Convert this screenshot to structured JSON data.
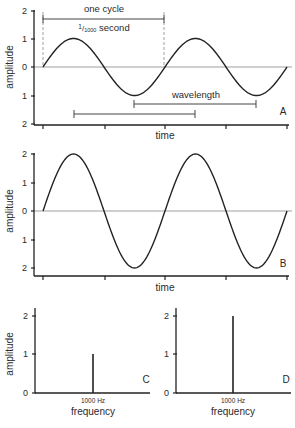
{
  "chart_data": [
    {
      "panel": "A",
      "type": "line",
      "title": "",
      "xlabel": "time",
      "ylabel": "amplitude",
      "yticks": [
        "2",
        "1",
        "0",
        "1",
        "2"
      ],
      "ylim": [
        -2,
        2
      ],
      "series": [
        {
          "name": "sine amplitude 1",
          "amplitude": 1,
          "cycles": 2
        }
      ],
      "annotations": {
        "one_cycle": "one cycle",
        "period": "1/1000 second",
        "period_num": "1",
        "period_den": "1000",
        "period_unit": "second",
        "wavelength": "wavelength"
      },
      "letter": "A"
    },
    {
      "panel": "B",
      "type": "line",
      "xlabel": "time",
      "ylabel": "amplitude",
      "yticks": [
        "2",
        "1",
        "0",
        "1",
        "2"
      ],
      "ylim": [
        -2,
        2
      ],
      "series": [
        {
          "name": "sine amplitude 2",
          "amplitude": 2,
          "cycles": 2
        }
      ],
      "letter": "B"
    },
    {
      "panel": "C",
      "type": "bar",
      "xlabel": "frequency",
      "ylabel": "amplitude",
      "yticks": [
        "0",
        "1",
        "2"
      ],
      "categories": [
        "1000 Hz"
      ],
      "values": [
        1
      ],
      "ylim": [
        0,
        2
      ],
      "letter": "C"
    },
    {
      "panel": "D",
      "type": "bar",
      "xlabel": "frequency",
      "ylabel": "",
      "yticks": [
        "0",
        "1",
        "2"
      ],
      "categories": [
        "1000 Hz"
      ],
      "values": [
        2
      ],
      "ylim": [
        0,
        2
      ],
      "letter": "D"
    }
  ],
  "labels": {
    "amplitude": "amplitude",
    "time": "time",
    "frequency": "frequency",
    "hz": "1000 Hz",
    "one_cycle": "one cycle",
    "per_second_num": "1",
    "per_second_den": "1000",
    "second": "second",
    "wavelength": "wavelength",
    "A": "A",
    "B": "B",
    "C": "C",
    "D": "D",
    "t2": "2",
    "t1": "1",
    "t0": "0"
  }
}
